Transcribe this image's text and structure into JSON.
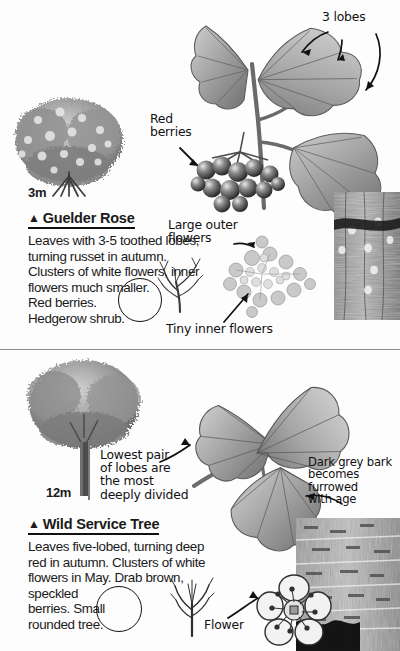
{
  "page": {
    "background": "#fdfdfd",
    "ink": "#111111"
  },
  "entries": [
    {
      "id": "guelder-rose",
      "marker": "▲",
      "name": "Guelder Rose",
      "height_label": "3m",
      "description": "Leaves with 3-5 toothed lobes, turning russet in autumn. Clusters of white flowers, inner flowers much smaller.\nRed berries.\nHedgerow shrub."
    },
    {
      "id": "wild-service-tree",
      "marker": "▲",
      "name": "Wild Service Tree",
      "height_label": "12m",
      "description": "Leaves five-lobed, turning deep red in autumn. Clusters of white flowers in May. Drab brown, speckled\nberries. Small\nrounded tree."
    }
  ],
  "annotations": [
    {
      "id": "three-lobes",
      "text": "3 lobes"
    },
    {
      "id": "red-berries",
      "text": "Red\nberries"
    },
    {
      "id": "large-outer",
      "text": "Large outer\nflowers"
    },
    {
      "id": "tiny-inner",
      "text": "Tiny inner flowers"
    },
    {
      "id": "lowest-pair",
      "text": "Lowest pair\nof lobes are\nthe most\ndeeply divided"
    },
    {
      "id": "dark-grey-bark",
      "text": "Dark grey bark\nbecomes\nfurrowed\nwith age"
    },
    {
      "id": "flower",
      "text": "Flower"
    }
  ],
  "illustrations": [
    {
      "id": "guelder-rose-shrub",
      "label": "dense shrub silhouette"
    },
    {
      "id": "guelder-rose-leaf-spray",
      "label": "lobed leaves on stem"
    },
    {
      "id": "guelder-rose-berry-cluster",
      "label": "cluster of red berries"
    },
    {
      "id": "guelder-rose-flowerhead",
      "label": "white flower corymb"
    },
    {
      "id": "guelder-rose-winter-twig",
      "label": "bare winter twig"
    },
    {
      "id": "guelder-rose-bark",
      "label": "bark texture panel"
    },
    {
      "id": "wild-service-tree-shape",
      "label": "rounded tree silhouette"
    },
    {
      "id": "wild-service-leaf-spray",
      "label": "five-lobed leaves on stem"
    },
    {
      "id": "wild-service-winter-twig",
      "label": "bare winter twig"
    },
    {
      "id": "wild-service-flower",
      "label": "five-petalled flower"
    },
    {
      "id": "wild-service-bark",
      "label": "furrowed bark panel"
    }
  ]
}
